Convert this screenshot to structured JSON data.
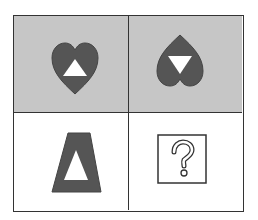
{
  "puzzle": {
    "colors": {
      "shaded_bg": "#c6c6c6",
      "shape_fill": "#555555",
      "inner": "#ffffff",
      "line": "#333333"
    },
    "cells": [
      {
        "position": "top-left",
        "background": "shaded",
        "shape": "heart",
        "orientation": "upright",
        "inner": "triangle-up"
      },
      {
        "position": "top-right",
        "background": "shaded",
        "shape": "heart",
        "orientation": "inverted",
        "inner": "triangle-down"
      },
      {
        "position": "bottom-left",
        "background": "white",
        "shape": "trapezoid",
        "inner": "triangle-up"
      },
      {
        "position": "bottom-right",
        "background": "white",
        "shape": "question-box",
        "label": "?"
      }
    ]
  }
}
